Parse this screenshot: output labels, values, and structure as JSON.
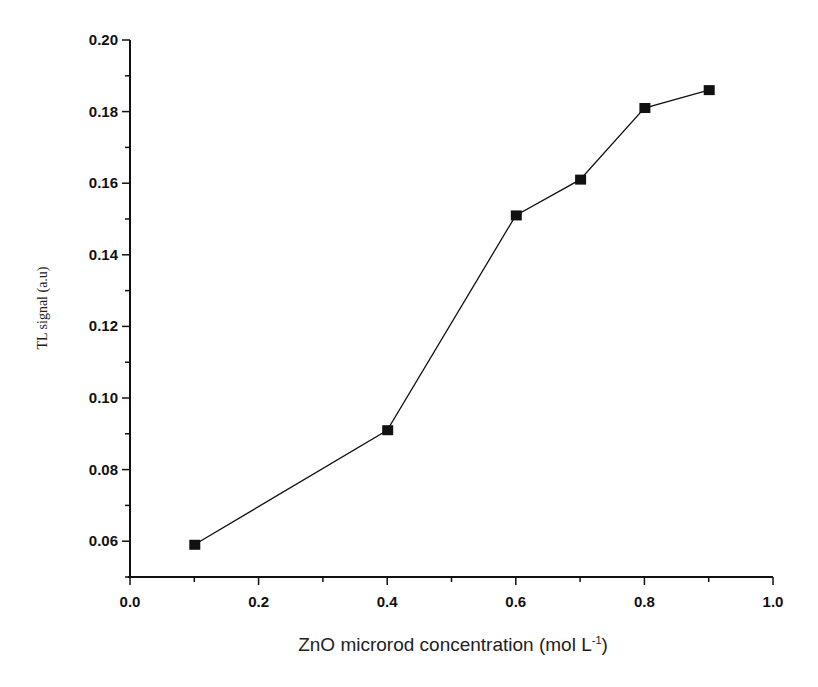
{
  "chart_data": {
    "type": "line",
    "title": "",
    "xlabel": "ZnO microrod concentration (mol L",
    "xlabel_sup": "-1",
    "xlabel_close": ")",
    "ylabel": "TL signal (a.u)",
    "xlim": [
      0.0,
      1.0
    ],
    "ylim": [
      0.05,
      0.2
    ],
    "x_ticks": [
      "0.0",
      "0.2",
      "0.4",
      "0.6",
      "0.8",
      "1.0"
    ],
    "y_ticks": [
      "0.06",
      "0.08",
      "0.10",
      "0.12",
      "0.14",
      "0.16",
      "0.18",
      "0.20"
    ],
    "grid": false,
    "legend": null,
    "series": [
      {
        "name": "TL signal",
        "marker": "square",
        "color": "#111111",
        "x": [
          0.1,
          0.4,
          0.6,
          0.7,
          0.8,
          0.9
        ],
        "values": [
          0.059,
          0.091,
          0.151,
          0.161,
          0.181,
          0.186
        ]
      }
    ]
  }
}
